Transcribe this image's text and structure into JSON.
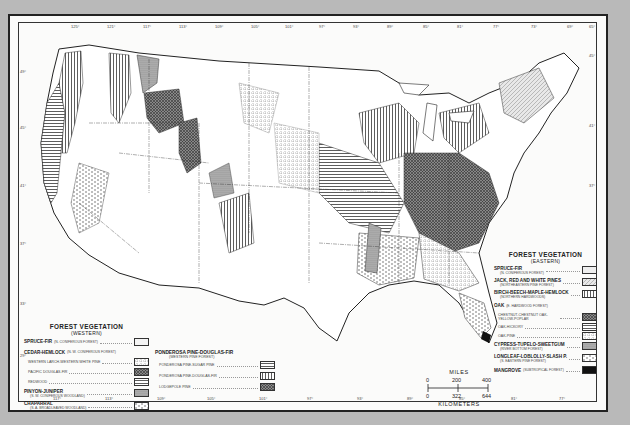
{
  "map": {
    "subject": "Forest Vegetation of the Conterminous United States",
    "longitude_ticks_top": [
      "125°",
      "121°",
      "117°",
      "113°",
      "109°",
      "105°",
      "101°",
      "97°",
      "93°",
      "89°",
      "85°",
      "81°",
      "77°",
      "73°",
      "69°",
      "65°"
    ],
    "longitude_ticks_bottom": [
      "117°",
      "113°",
      "109°",
      "105°",
      "101°",
      "97°",
      "93°",
      "89°",
      "85°",
      "81°",
      "77°"
    ],
    "latitude_ticks_left": [
      "49°",
      "45°",
      "41°",
      "37°",
      "33°",
      "29°"
    ],
    "latitude_ticks_right": [
      "45°",
      "41°",
      "37°"
    ]
  },
  "legend_western": {
    "title": "FOREST VEGETATION",
    "subtitle": "(WESTERN)",
    "items": [
      {
        "label": "SPRUCE-FIR",
        "note": "(N. CONIFEROUS FOREST)",
        "major": true,
        "pattern": "plain-light"
      },
      {
        "label": "CEDAR-HEMLOCK",
        "note": "(N. W. CONIFEROUS FOREST)",
        "major": true,
        "pattern": "none"
      },
      {
        "label": "WESTERN LARCH-WESTERN WHITE PINE",
        "note": "",
        "major": false,
        "pattern": "dotted-grid"
      },
      {
        "label": "PACIFIC DOUGLAS-FIR",
        "note": "",
        "major": false,
        "pattern": "crosshatch"
      },
      {
        "label": "REDWOOD",
        "note": "",
        "major": false,
        "pattern": "horizontal-lines"
      },
      {
        "label": "PINYON-JUNIPER",
        "note": "(S. W. CONIFEROUS WOODLAND)",
        "major": true,
        "pattern": "dense-stipple"
      },
      {
        "label": "CHAPARRAL",
        "note": "(S. A. BROADLEAVED WOODLAND)",
        "major": true,
        "pattern": "dashes"
      }
    ]
  },
  "legend_ponderosa": {
    "title": "PONDEROSA PINE-DOUGLAS-FIR",
    "subtitle": "(WESTERN PINE FOREST)",
    "items": [
      {
        "label": "PONDEROSA PINE-SUGAR PINE",
        "pattern": "horizontal-lines"
      },
      {
        "label": "PONDEROSA PINE-DOUGLAS-FIR",
        "pattern": "vertical-lines"
      },
      {
        "label": "LODGEPOLE PINE",
        "pattern": "dark-crosshatch"
      }
    ]
  },
  "legend_eastern": {
    "title": "FOREST VEGETATION",
    "subtitle": "(EASTERN)",
    "items": [
      {
        "label": "SPRUCE-FIR",
        "note": "(N. CONIFEROUS FOREST)",
        "major": true,
        "pattern": "plain-light"
      },
      {
        "label": "JACK, RED AND WHITE PINES",
        "note": "(NORTHEASTERN PINE FOREST)",
        "major": true,
        "pattern": "diagonal-light"
      },
      {
        "label": "BIRCH-BEECH-MAPLE-HEMLOCK",
        "note": "(NORTHERN HARDWOODS)",
        "major": true,
        "pattern": "vertical-lines"
      },
      {
        "label": "OAK",
        "note": "(E. HARDWOOD FOREST)",
        "major": true,
        "pattern": "none"
      },
      {
        "label": "CHESTNUT-CHESTNUT OAK-YELLOW-POPLAR",
        "note": "",
        "major": false,
        "pattern": "dark-crosshatch"
      },
      {
        "label": "OAK-HICKORY",
        "note": "",
        "major": false,
        "pattern": "horizontal-lines"
      },
      {
        "label": "OAK-PINE",
        "note": "",
        "major": false,
        "pattern": "dotted-grid"
      },
      {
        "label": "CYPRESS-TUPELO-SWEETGUM",
        "note": "(RIVER BOTTOM FOREST)",
        "major": true,
        "pattern": "dense-stipple"
      },
      {
        "label": "LONGLEAF-LOBLOLLY-SLASH P.",
        "note": "(S. EASTERN PINE FOREST)",
        "major": true,
        "pattern": "dashes"
      },
      {
        "label": "MANGROVE",
        "note": "(SUBTROPICAL FOREST)",
        "major": true,
        "pattern": "solid-black"
      }
    ]
  },
  "scale_bar": {
    "miles_label": "MILES",
    "miles_values": [
      "0",
      "200",
      "400"
    ],
    "km_values": [
      "0",
      "322",
      "644"
    ],
    "km_label": "KILOMETERS"
  },
  "colors": {
    "background": "#b9b9b9",
    "paper": "#fbfbfa",
    "ink": "#222222",
    "dark_fill": "#7a7a7a",
    "mid_fill": "#a8a8a8"
  }
}
